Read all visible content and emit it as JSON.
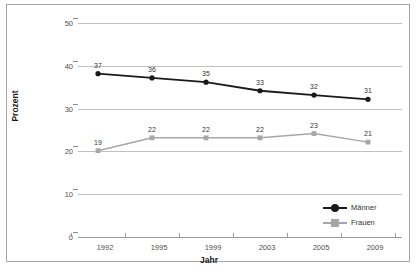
{
  "chart_data": {
    "type": "line",
    "title": "",
    "xlabel": "Jahr",
    "ylabel": "Prozent",
    "categories": [
      "1992",
      "1995",
      "1999",
      "2003",
      "2005",
      "2009"
    ],
    "ylim": [
      0,
      50
    ],
    "yticks": [
      0,
      10,
      20,
      30,
      40,
      50
    ],
    "grid": true,
    "legend_position": "bottom-right",
    "series": [
      {
        "name": "Männer",
        "color": "#1a1a1a",
        "marker": "circle",
        "values": [
          37,
          36,
          35,
          33,
          32,
          31
        ],
        "labels": [
          "37",
          "36",
          "35",
          "33",
          "32",
          "31"
        ]
      },
      {
        "name": "Frauen",
        "color": "#a6a6a6",
        "marker": "square",
        "values": [
          19,
          22,
          22,
          22,
          23,
          21
        ],
        "labels": [
          "19",
          "22",
          "22",
          "22",
          "23",
          "21"
        ]
      }
    ]
  },
  "caption": {
    "text": ""
  }
}
